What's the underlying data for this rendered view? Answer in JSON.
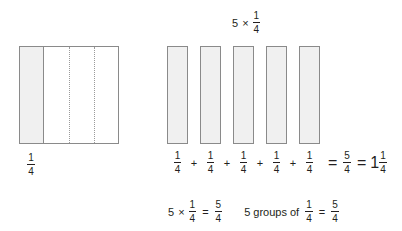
{
  "title": {
    "factor": "5",
    "times": "×",
    "fraction": {
      "numerator": "1",
      "denominator": "4"
    }
  },
  "unit_square_model": {
    "label": {
      "numerator": "1",
      "denominator": "4"
    },
    "total_parts": 4,
    "shaded_parts": 1,
    "shade_color": "#f0f0f0",
    "outline_color": "#8a8a8a",
    "divider_style": "dotted"
  },
  "bars_model": {
    "count": 5,
    "shade_color": "#f0f0f0",
    "outline_color": "#8a8a8a",
    "bars": [
      {
        "numerator": "1",
        "denominator": "4"
      },
      {
        "numerator": "1",
        "denominator": "4"
      },
      {
        "numerator": "1",
        "denominator": "4"
      },
      {
        "numerator": "1",
        "denominator": "4"
      },
      {
        "numerator": "1",
        "denominator": "4"
      }
    ]
  },
  "addition_sentence": {
    "plus": "+",
    "equals": "=",
    "sum": {
      "numerator": "5",
      "denominator": "4"
    },
    "mixed": {
      "whole": "1",
      "numerator": "1",
      "denominator": "4"
    }
  },
  "bottom_row": {
    "left_sentence": {
      "factor": "5",
      "times": "×",
      "fraction": {
        "numerator": "1",
        "denominator": "4"
      },
      "equals": "=",
      "product": {
        "numerator": "5",
        "denominator": "4"
      }
    },
    "right_sentence": {
      "text": "5 groups of",
      "fraction": {
        "numerator": "1",
        "denominator": "4"
      },
      "equals": "=",
      "result": {
        "numerator": "5",
        "denominator": "4"
      }
    }
  }
}
